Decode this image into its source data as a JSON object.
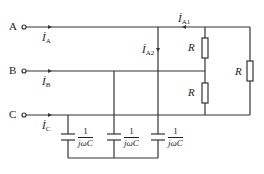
{
  "diagram": {
    "type": "three-phase circuit",
    "colors": {
      "stroke": "#333333",
      "background": "#ffffff"
    },
    "terminals": [
      {
        "label": "A",
        "current": "İ",
        "current_sub": "A"
      },
      {
        "label": "B",
        "current": "İ",
        "current_sub": "B"
      },
      {
        "label": "C",
        "current": "İ",
        "current_sub": "C"
      }
    ],
    "branch_currents": [
      {
        "symbol": "İ",
        "sub": "A1"
      },
      {
        "symbol": "İ",
        "sub": "A2"
      }
    ],
    "resistors": [
      {
        "label": "R"
      },
      {
        "label": "R"
      },
      {
        "label": "R"
      }
    ],
    "capacitors": [
      {
        "num": "1",
        "den": "jωC"
      },
      {
        "num": "1",
        "den": "jωC"
      },
      {
        "num": "1",
        "den": "jωC"
      }
    ]
  }
}
